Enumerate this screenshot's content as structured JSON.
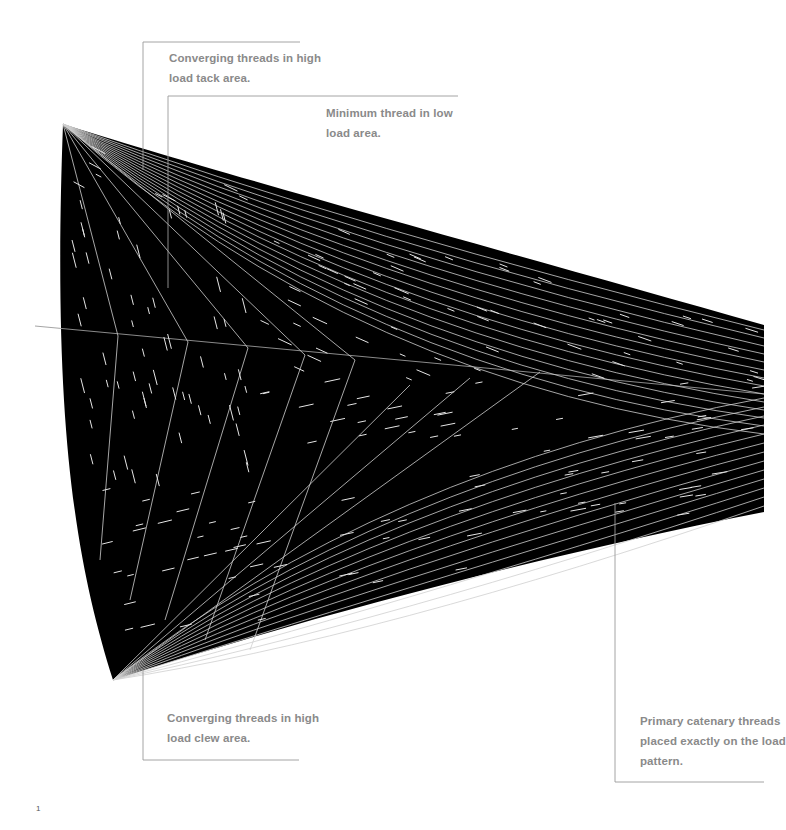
{
  "diagram": {
    "colors": {
      "sail_fill": "#000000",
      "thread_line": "#d8d8d8",
      "leader_line": "#9a9a9a",
      "callout_text": "#8a8a8a",
      "background": "#ffffff"
    },
    "corners": {
      "tack": {
        "x": 63,
        "y": 124
      },
      "clew": {
        "x": 113,
        "y": 680
      }
    }
  },
  "callouts": [
    {
      "id": "tack",
      "line1": "Converging threads in high",
      "line2": "load tack area."
    },
    {
      "id": "low-load",
      "line1": "Minimum thread in low",
      "line2": "load area."
    },
    {
      "id": "clew",
      "line1": "Converging threads in high",
      "line2": "load clew area."
    },
    {
      "id": "catenary",
      "line1": "Primary catenary threads",
      "line2": "placed exactly on the load",
      "line3": "pattern."
    }
  ],
  "page": {
    "number": "1"
  }
}
